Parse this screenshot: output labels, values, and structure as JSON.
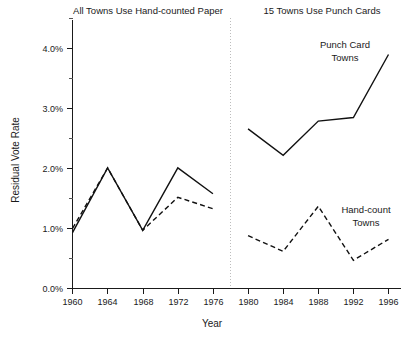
{
  "chart_data": {
    "type": "line",
    "title": "",
    "xlabel": "Year",
    "ylabel": "Residual Vote Rate",
    "panels": [
      {
        "name": "left-panel",
        "title": "All Towns Use Hand-counted Paper",
        "x": [
          1960,
          1964,
          1968,
          1972,
          1976
        ],
        "series": [
          {
            "name": "Punch Card Towns",
            "style": "solid",
            "values": [
              0.93,
              2.01,
              0.97,
              2.01,
              1.58
            ]
          },
          {
            "name": "Hand-count Towns",
            "style": "dashed",
            "values": [
              1.0,
              2.01,
              0.97,
              1.52,
              1.33
            ]
          }
        ]
      },
      {
        "name": "right-panel",
        "title": "15 Towns Use Punch Cards",
        "x": [
          1980,
          1984,
          1988,
          1992,
          1996
        ],
        "series": [
          {
            "name": "Punch Card Towns",
            "style": "solid",
            "values": [
              2.66,
              2.22,
              2.79,
              2.85,
              3.9
            ]
          },
          {
            "name": "Hand-count Towns",
            "style": "dashed",
            "values": [
              0.88,
              0.62,
              1.37,
              0.47,
              0.82
            ]
          }
        ]
      }
    ],
    "annotations": [
      {
        "name": "punch-card-towns-label",
        "lines": [
          "Punch Card",
          "Towns"
        ],
        "x": 1990.2,
        "y": 4.05
      },
      {
        "name": "hand-count-towns-label",
        "lines": [
          "Hand-count",
          "Towns"
        ],
        "x": 1993.6,
        "y": 1.27
      }
    ],
    "xticks": [
      1960,
      1964,
      1968,
      1972,
      1976,
      1980,
      1984,
      1988,
      1992,
      1996
    ],
    "xtick_labels": [
      "1960",
      "1964",
      "1968",
      "1972",
      "1976",
      "1980",
      "1984",
      "1988",
      "1992",
      "1996"
    ],
    "yticks": [
      0.0,
      1.0,
      2.0,
      3.0,
      4.0
    ],
    "ytick_labels": [
      "0.0%",
      "1.0%",
      "2.0%",
      "3.0%",
      "4.0%"
    ],
    "yminor_ticks": [
      0.5,
      1.5,
      2.5,
      3.5,
      4.5
    ],
    "ylim": [
      0.0,
      4.6
    ],
    "xlim": [
      1958.2,
      1998.0
    ],
    "grid": false,
    "legend": "annotations-inline",
    "panel_divider_x": 1978.0,
    "colors": {
      "line": "#111111",
      "axis": "#1a1a1a",
      "divider": "#bdbdbd",
      "background": "#ffffff"
    }
  }
}
